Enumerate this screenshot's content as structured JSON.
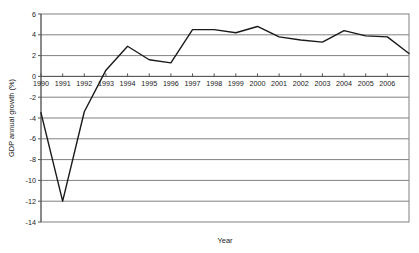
{
  "chart_data": {
    "type": "line",
    "title": "",
    "xlabel": "Year",
    "ylabel": "GDP annual growth (%)",
    "x": [
      1990,
      1991,
      1992,
      1993,
      1994,
      1995,
      1996,
      1997,
      1998,
      1999,
      2000,
      2001,
      2002,
      2003,
      2004,
      2005,
      2006,
      2007
    ],
    "categories": [
      "1990",
      "1991",
      "1992",
      "1993",
      "1994",
      "1995",
      "1996",
      "1997",
      "1998",
      "1999",
      "2000",
      "2001",
      "2002",
      "2003",
      "2004",
      "2005",
      "2006",
      ""
    ],
    "values": [
      -3.5,
      -12.0,
      -3.4,
      0.6,
      2.9,
      1.6,
      1.3,
      4.5,
      4.5,
      4.2,
      4.8,
      3.8,
      3.5,
      3.3,
      4.4,
      3.9,
      3.8,
      2.2
    ],
    "series": [
      {
        "name": "GDP annual growth (%)",
        "color": "#1a1a1a",
        "values": [
          -3.5,
          -12.0,
          -3.4,
          0.6,
          2.9,
          1.6,
          1.3,
          4.5,
          4.5,
          4.2,
          4.8,
          3.8,
          3.5,
          3.3,
          4.4,
          3.9,
          3.8,
          2.2
        ]
      }
    ],
    "xlim": [
      1990,
      2007
    ],
    "ylim": [
      -14,
      6
    ],
    "ytick_labels": [
      "6",
      "4",
      "2",
      "0",
      "-2",
      "-4",
      "-6",
      "-8",
      "-10",
      "-12",
      "-14"
    ],
    "ytick_values": [
      6,
      4,
      2,
      0,
      -2,
      -4,
      -6,
      -8,
      -10,
      -12,
      -14
    ],
    "xtick_labels": [
      "1990",
      "1991",
      "1992",
      "1993",
      "1994",
      "1995",
      "1996",
      "1997",
      "1998",
      "1999",
      "2000",
      "2001",
      "2002",
      "2003",
      "2004",
      "2005",
      "2006"
    ],
    "grid": true,
    "grid_color": "#808080",
    "legend": "none",
    "plot_border_color": "#808080",
    "background": "#ffffff"
  }
}
